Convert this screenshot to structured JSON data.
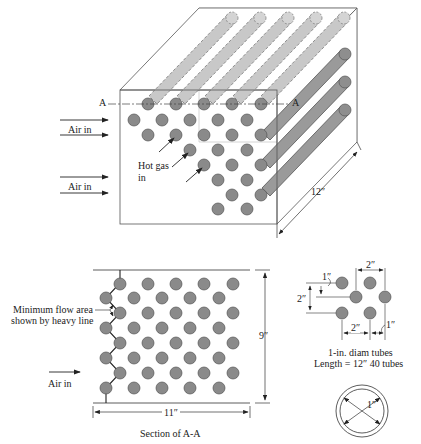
{
  "figure": {
    "isometric": {
      "air_in_labels": [
        "Air in",
        "Air in"
      ],
      "section_marker_left": "A",
      "section_marker_right": "A",
      "hot_gas_label_line1": "Hot gas",
      "hot_gas_label_line2": "in",
      "depth_dimension": "12″"
    },
    "section": {
      "title": "Section of A-A",
      "min_flow_label_line1": "Minimum flow area",
      "min_flow_label_line2": "shown by heavy line",
      "air_in_label": "Air in",
      "height_dimension": "9″",
      "width_dimension": "11″"
    },
    "pitch_detail": {
      "top_spacing": "2″",
      "vertical_spacing": "2″",
      "vertical_offset": "1″",
      "bottom_spacing": "2″",
      "horizontal_offset": "1″",
      "caption_line1": "1-in. diam tubes",
      "caption_line2": "Length = 12″  40 tubes"
    },
    "tube_detail": {
      "diameter": "1″"
    },
    "colors": {
      "tube_fill": "#8a8a8a",
      "tube_stroke": "#555555",
      "tube_back": "#c4c4c4",
      "line": "#333333"
    }
  }
}
